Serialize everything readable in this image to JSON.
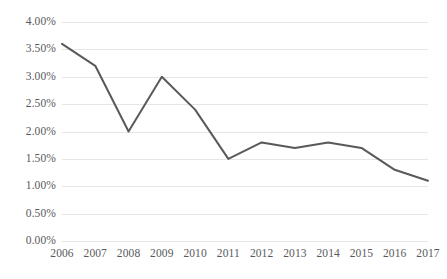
{
  "chart_data": {
    "type": "line",
    "title": "",
    "subtitle": "",
    "xlabel": "",
    "ylabel": "",
    "categories": [
      "2006",
      "2007",
      "2008",
      "2009",
      "2010",
      "2011",
      "2012",
      "2013",
      "2014",
      "2015",
      "2016",
      "2017"
    ],
    "x": [
      2006,
      2007,
      2008,
      2009,
      2010,
      2011,
      2012,
      2013,
      2014,
      2015,
      2016,
      2017
    ],
    "values": [
      3.6,
      3.2,
      2.0,
      3.0,
      2.4,
      1.5,
      1.8,
      1.7,
      1.8,
      1.7,
      1.3,
      1.1
    ],
    "value_labels": [
      "3.60%",
      "3.20%",
      "2.00%",
      "3.00%",
      "2.40%",
      "1.50%",
      "1.80%",
      "1.70%",
      "1.80%",
      "1.70%",
      "1.30%",
      "1.10%"
    ],
    "ylim": [
      0,
      4
    ],
    "ytick_values": [
      0,
      0.5,
      1.0,
      1.5,
      2.0,
      2.5,
      3.0,
      3.5,
      4.0
    ],
    "ytick_labels": [
      "0.00%",
      "0.50%",
      "1.00%",
      "1.50%",
      "2.00%",
      "2.50%",
      "3.00%",
      "3.50%",
      "4.00%"
    ],
    "grid": true,
    "grid_axis": "y",
    "legend": false,
    "legend_position": "none",
    "markers": false,
    "series": [
      {
        "name": "",
        "values": [
          3.6,
          3.2,
          2.0,
          3.0,
          2.4,
          1.5,
          1.8,
          1.7,
          1.8,
          1.7,
          1.3,
          1.1
        ]
      }
    ],
    "colors": {
      "line": "#595959",
      "grid": "#e6e6e6",
      "text": "#58595b",
      "background": "#ffffff"
    }
  }
}
